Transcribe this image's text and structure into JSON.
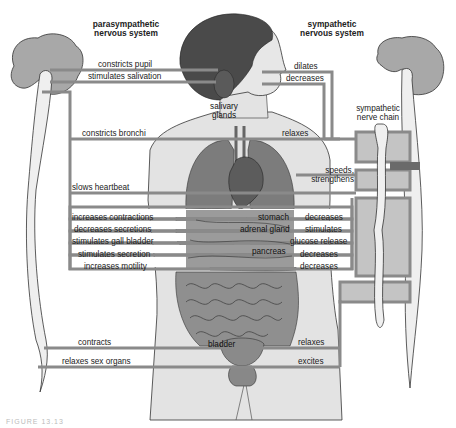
{
  "headers": {
    "parasympathetic": "parasympathetic\nnervous system",
    "sympathetic": "sympathetic\nnervous system",
    "nerve_chain": "sympathetic\nnerve chain"
  },
  "organ_labels": {
    "salivary_glands": "salivary\nglands",
    "stomach": "stomach",
    "adrenal_gland": "adrenal gland",
    "pancreas": "pancreas",
    "bladder": "bladder"
  },
  "parasympathetic_effects": [
    {
      "target": "pupil",
      "label": "constricts pupil"
    },
    {
      "target": "salivary glands",
      "label": "stimulates salivation"
    },
    {
      "target": "bronchi",
      "label": "constricts bronchi"
    },
    {
      "target": "heart",
      "label": "slows heartbeat"
    },
    {
      "target": "stomach",
      "label": "increases contractions"
    },
    {
      "target": "stomach",
      "label": "decreases secretions"
    },
    {
      "target": "gall bladder",
      "label": "stimulates gall bladder"
    },
    {
      "target": "pancreas",
      "label": "stimulates secretion"
    },
    {
      "target": "intestine",
      "label": "increases motility"
    },
    {
      "target": "bladder",
      "label": "contracts"
    },
    {
      "target": "sex organs",
      "label": "relaxes sex organs"
    }
  ],
  "sympathetic_effects": [
    {
      "target": "pupil",
      "label": "dilates"
    },
    {
      "target": "salivary glands",
      "label": "decreases"
    },
    {
      "target": "bronchi",
      "label": "relaxes"
    },
    {
      "target": "heart",
      "label": "speeds,\nstrengthens"
    },
    {
      "target": "stomach",
      "label": "decreases"
    },
    {
      "target": "adrenal gland",
      "label": "stimulates"
    },
    {
      "target": "liver",
      "label": "glucose release"
    },
    {
      "target": "pancreas",
      "label": "decreases"
    },
    {
      "target": "intestine",
      "label": "decreases"
    },
    {
      "target": "bladder",
      "label": "relaxes"
    },
    {
      "target": "sex organs",
      "label": "excites"
    }
  ],
  "caption": "FIGURE 13.13",
  "colors": {
    "nerve_line": "#8a8a8a",
    "brain": "#a8a8a8",
    "spinal_cord": "#efefef",
    "hair": "#4a4a4a",
    "skin": "#e2e2e2",
    "organ_dark": "#6e6e6e",
    "organ_mid": "#8c8c8c",
    "ganglion_box": "#c4c4c4"
  }
}
